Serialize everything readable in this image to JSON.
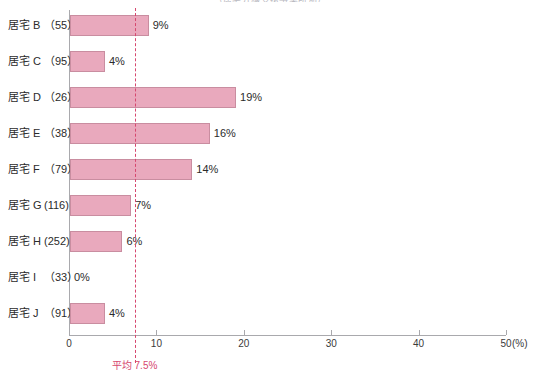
{
  "chart_data": {
    "type": "bar",
    "orientation": "horizontal",
    "title": "（居宅介護支援事業所別）",
    "xlabel": "",
    "ylabel": "",
    "unit": "(%)",
    "xlim": [
      0,
      50
    ],
    "xticks": [
      0,
      10,
      20,
      30,
      40,
      50
    ],
    "xtick_labels": [
      "0",
      "10",
      "20",
      "30",
      "40",
      "50"
    ],
    "grid": false,
    "legend": "none",
    "bar_color": "#e9a9bd",
    "bar_border_color": "#c98da0",
    "reference_color": "#d6476e",
    "axis_color": "#a9a9ad",
    "categories": [
      "居宅 B",
      "居宅 C",
      "居宅 D",
      "居宅 E",
      "居宅 F",
      "居宅 G",
      "居宅 H",
      "居宅 I",
      "居宅 J"
    ],
    "counts": [
      "（55）",
      "（95）",
      "（26）",
      "（38）",
      "（79）",
      "(116)",
      "(252)",
      "（33）",
      "（91）"
    ],
    "values": [
      9,
      4,
      19,
      16,
      14,
      7,
      6,
      0,
      4
    ],
    "value_labels": [
      "9%",
      "4%",
      "19%",
      "16%",
      "14%",
      "7%",
      "6%",
      "0%",
      "4%"
    ],
    "reference_line": {
      "value": 7.5,
      "label": "平均 7.5%"
    }
  }
}
